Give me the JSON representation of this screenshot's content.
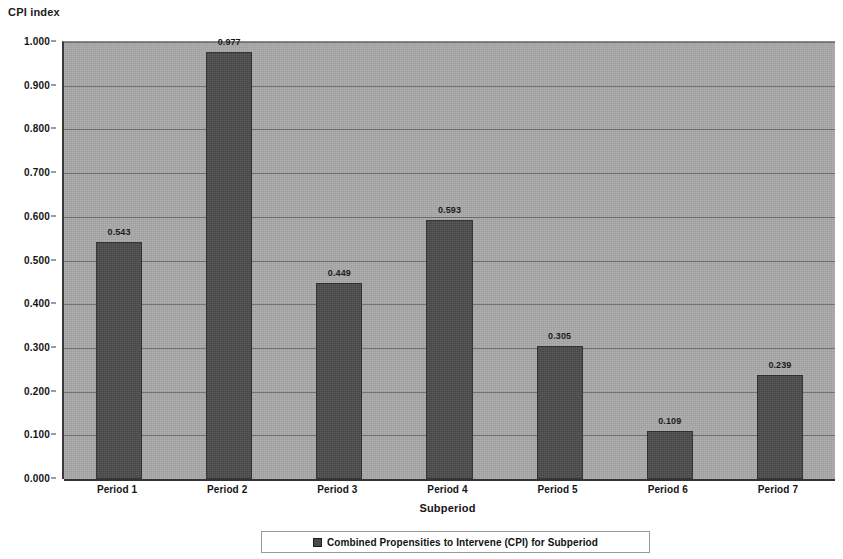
{
  "chart_data": {
    "type": "bar",
    "title": "",
    "ylabel": "CPI index",
    "xlabel": "Subperiod",
    "categories": [
      "Period 1",
      "Period 2",
      "Period 3",
      "Period 4",
      "Period 5",
      "Period 6",
      "Period 7"
    ],
    "values": [
      0.543,
      0.977,
      0.449,
      0.593,
      0.305,
      0.109,
      0.239
    ],
    "value_labels": [
      "0.543",
      "0.977",
      "0.449",
      "0.593",
      "0.305",
      "0.109",
      "0.239"
    ],
    "ylim": [
      0.0,
      1.0
    ],
    "ytick_labels": [
      "0.000",
      "0.100",
      "0.200",
      "0.300",
      "0.400",
      "0.500",
      "0.600",
      "0.700",
      "0.800",
      "0.900",
      "1.000"
    ],
    "ytick_values": [
      0.0,
      0.1,
      0.2,
      0.3,
      0.4,
      0.5,
      0.6,
      0.7,
      0.8,
      0.9,
      1.0
    ],
    "grid": true,
    "legend_position": "bottom",
    "series": [
      {
        "name": "Combined Propensities to Intervene (CPI) for Subperiod",
        "color": "#4b4b4b",
        "values": [
          0.543,
          0.977,
          0.449,
          0.593,
          0.305,
          0.109,
          0.239
        ]
      }
    ],
    "plot_background": "#a9a9a9"
  },
  "legend": {
    "items": [
      {
        "label": "Combined Propensities to Intervene (CPI) for Subperiod",
        "swatch_icon": "filled-square-icon"
      }
    ]
  }
}
